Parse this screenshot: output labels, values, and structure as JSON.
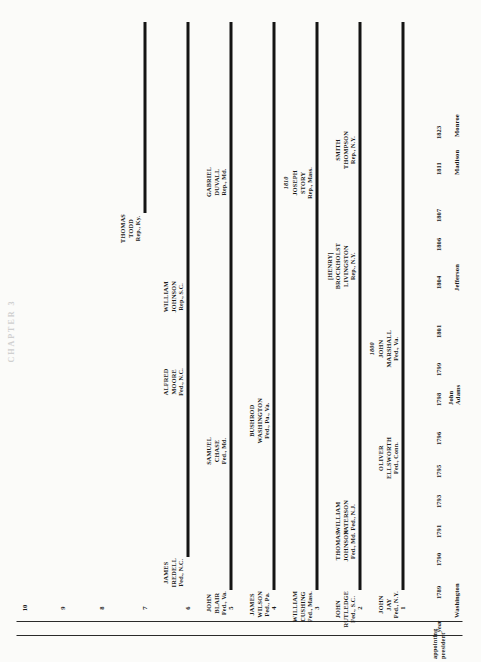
{
  "plate": {
    "faded_header": "CHAPTER 3"
  },
  "axis": {
    "corner_label_line1": "appointing",
    "corner_label_line2": "president",
    "year_header": "year",
    "seat_numbers": [
      "1",
      "2",
      "3",
      "4",
      "5",
      "6",
      "7",
      "8",
      "9",
      "10"
    ]
  },
  "presidents": [
    {
      "name": "Washington",
      "year": "1789"
    },
    {
      "name": "",
      "year": "1790"
    },
    {
      "name": "",
      "year": "1791"
    },
    {
      "name": "",
      "year": "1793"
    },
    {
      "name": "",
      "year": "1795"
    },
    {
      "name": "",
      "year": "1796"
    },
    {
      "name": "John\nAdams",
      "year": "1798"
    },
    {
      "name": "",
      "year": "1799"
    },
    {
      "name": "",
      "year": "1801"
    },
    {
      "name": "Jefferson",
      "year": "1804"
    },
    {
      "name": "",
      "year": "1806"
    },
    {
      "name": "",
      "year": "1807"
    },
    {
      "name": "Madison",
      "year": "1811"
    },
    {
      "name": "Monroe",
      "year": "1823"
    }
  ],
  "president_labels": [
    {
      "name": "Washington",
      "year": "1789"
    },
    {
      "name": "John Adams",
      "year": "1798"
    },
    {
      "name": "Jefferson",
      "year": "1804"
    },
    {
      "name": "Madison",
      "year": "1811"
    },
    {
      "name": "Monroe",
      "year": "1823"
    }
  ],
  "years": [
    "1789",
    "1790",
    "1791",
    "1793",
    "1795",
    "1796",
    "1798",
    "1799",
    "1801",
    "1804",
    "1806",
    "1807",
    "1811",
    "1823"
  ],
  "chart_data": {
    "type": "table",
    "xlabel": "seat",
    "ylabel": "year",
    "seats": [
      "1",
      "2",
      "3",
      "4",
      "5",
      "6",
      "7",
      "8",
      "9",
      "10"
    ],
    "justices": [
      {
        "seat": 1,
        "name_lines": [
          "JOHN",
          "JAY"
        ],
        "affiliation": "Fed., N.Y.",
        "start_year": "1789",
        "year_mark": ""
      },
      {
        "seat": 1,
        "name_lines": [
          "OLIVER",
          "ELLSWORTH"
        ],
        "affiliation": "Fed., Conn.",
        "start_year": "1796",
        "year_mark": ""
      },
      {
        "seat": 1,
        "name_lines": [
          "JOHN",
          "MARSHALL"
        ],
        "affiliation": "Fed., Va.",
        "start_year": "1801",
        "year_mark": "1800"
      },
      {
        "seat": 2,
        "name_lines": [
          "JOHN",
          "RUTLEDGE"
        ],
        "affiliation": "Fed., S.C.",
        "start_year": "1789",
        "year_mark": ""
      },
      {
        "seat": 2,
        "name_lines": [
          "THOMAS",
          "JOHNSON"
        ],
        "affiliation": "Fed., Md.",
        "start_year": "1791",
        "year_mark": ""
      },
      {
        "seat": 2,
        "name_lines": [
          "WILLIAM",
          "PATERSON"
        ],
        "affiliation": "Fed., N.J.",
        "start_year": "1793",
        "year_mark": ""
      },
      {
        "seat": 2,
        "name_lines": [
          "[HENRY]",
          "BROCKHOLST",
          "LIVINGSTON"
        ],
        "affiliation": "Rep., N.Y.",
        "start_year": "1806",
        "year_mark": ""
      },
      {
        "seat": 2,
        "name_lines": [
          "SMITH",
          "THOMPSON"
        ],
        "affiliation": "Rep., N.Y.",
        "start_year": "1823",
        "year_mark": ""
      },
      {
        "seat": 3,
        "name_lines": [
          "WILLIAM",
          "CUSHING"
        ],
        "affiliation": "Fed., Mass.",
        "start_year": "1789",
        "year_mark": ""
      },
      {
        "seat": 3,
        "name_lines": [
          "JOSEPH",
          "STORY"
        ],
        "affiliation": "Rep., Mass.",
        "start_year": "1811",
        "year_mark": "1810"
      },
      {
        "seat": 4,
        "name_lines": [
          "JAMES",
          "WILSON"
        ],
        "affiliation": "Fed., Pa.",
        "start_year": "1789",
        "year_mark": ""
      },
      {
        "seat": 4,
        "name_lines": [
          "BUSHROD",
          "WASHINGTON"
        ],
        "affiliation": "Fed., Pa., Va.",
        "start_year": "1798",
        "year_mark": ""
      },
      {
        "seat": 5,
        "name_lines": [
          "JOHN",
          "BLAIR"
        ],
        "affiliation": "Fed., Va.",
        "start_year": "1789",
        "year_mark": ""
      },
      {
        "seat": 5,
        "name_lines": [
          "SAMUEL",
          "CHASE"
        ],
        "affiliation": "Fed., Md.",
        "start_year": "1796",
        "year_mark": ""
      },
      {
        "seat": 5,
        "name_lines": [
          "GABRIEL",
          "DUVALL"
        ],
        "affiliation": "Rep., Md.",
        "start_year": "1811",
        "year_mark": ""
      },
      {
        "seat": 6,
        "name_lines": [
          "JAMES",
          "IREDELL"
        ],
        "affiliation": "Fed., N.C.",
        "start_year": "1790",
        "year_mark": ""
      },
      {
        "seat": 6,
        "name_lines": [
          "ALFRED",
          "MOORE"
        ],
        "affiliation": "Fed., N.C.",
        "start_year": "1799",
        "year_mark": ""
      },
      {
        "seat": 6,
        "name_lines": [
          "WILLIAM",
          "JOHNSON"
        ],
        "affiliation": "Rep., S.C.",
        "start_year": "1804",
        "year_mark": ""
      },
      {
        "seat": 7,
        "name_lines": [
          "THOMAS",
          "TODD"
        ],
        "affiliation": "Rep., Ky.",
        "start_year": "1807",
        "year_mark": ""
      }
    ]
  }
}
